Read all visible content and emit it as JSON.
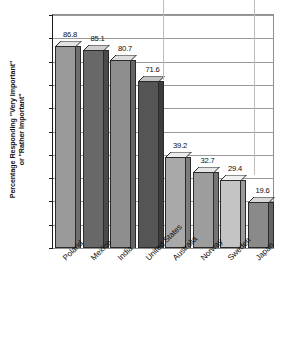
{
  "chart_data": {
    "type": "bar",
    "title": "",
    "subtitle": "",
    "xlabel": "",
    "ylabel": "Percentage Responding \"Very Important\" or \"Rather Important\"",
    "ylabel_lines": [
      "Percentage Responding \"Very Important\"",
      "or \"Rather Important\""
    ],
    "categories": [
      "Poland",
      "Mexico",
      "India",
      "United States",
      "Australia",
      "Norway",
      "Sweden",
      "Japan"
    ],
    "values": [
      86.8,
      85.1,
      80.7,
      71.6,
      39.2,
      32.7,
      29.4,
      19.6
    ],
    "value_labels": [
      "86.8",
      "85.1",
      "80.7",
      "71.6",
      "39.2",
      "32.7",
      "29.4",
      "19.6"
    ],
    "ylim": [
      0,
      100
    ],
    "ytick_values": [
      0,
      10,
      20,
      30,
      40,
      50,
      60,
      70,
      80,
      90,
      100
    ],
    "ytick_labels": [
      "0",
      "10",
      "20",
      "30",
      "40",
      "50",
      "60",
      "70",
      "80",
      "90",
      "100"
    ],
    "grid": true,
    "legend": "none",
    "bar_style": "3d",
    "bar_colors": [
      "#9a9a9a",
      "#686868",
      "#8e8e8e",
      "#555555",
      "#a9a9a9",
      "#9d9d9d",
      "#c4c4c4",
      "#8a8a8a"
    ],
    "bar_top_colors": [
      "#e2e2e2",
      "#cfcfcf",
      "#dddddd",
      "#c2c2c2",
      "#ececec",
      "#e6e6e6",
      "#f1f1f1",
      "#d8d8d8"
    ],
    "bar_side_colors": [
      "#6f6f6f",
      "#4a4a4a",
      "#666666",
      "#3c3c3c",
      "#7d7d7d",
      "#747474",
      "#9a9a9a",
      "#636363"
    ],
    "axis_color": "#1c1c1c",
    "grid_color": "#9a9a9a"
  }
}
